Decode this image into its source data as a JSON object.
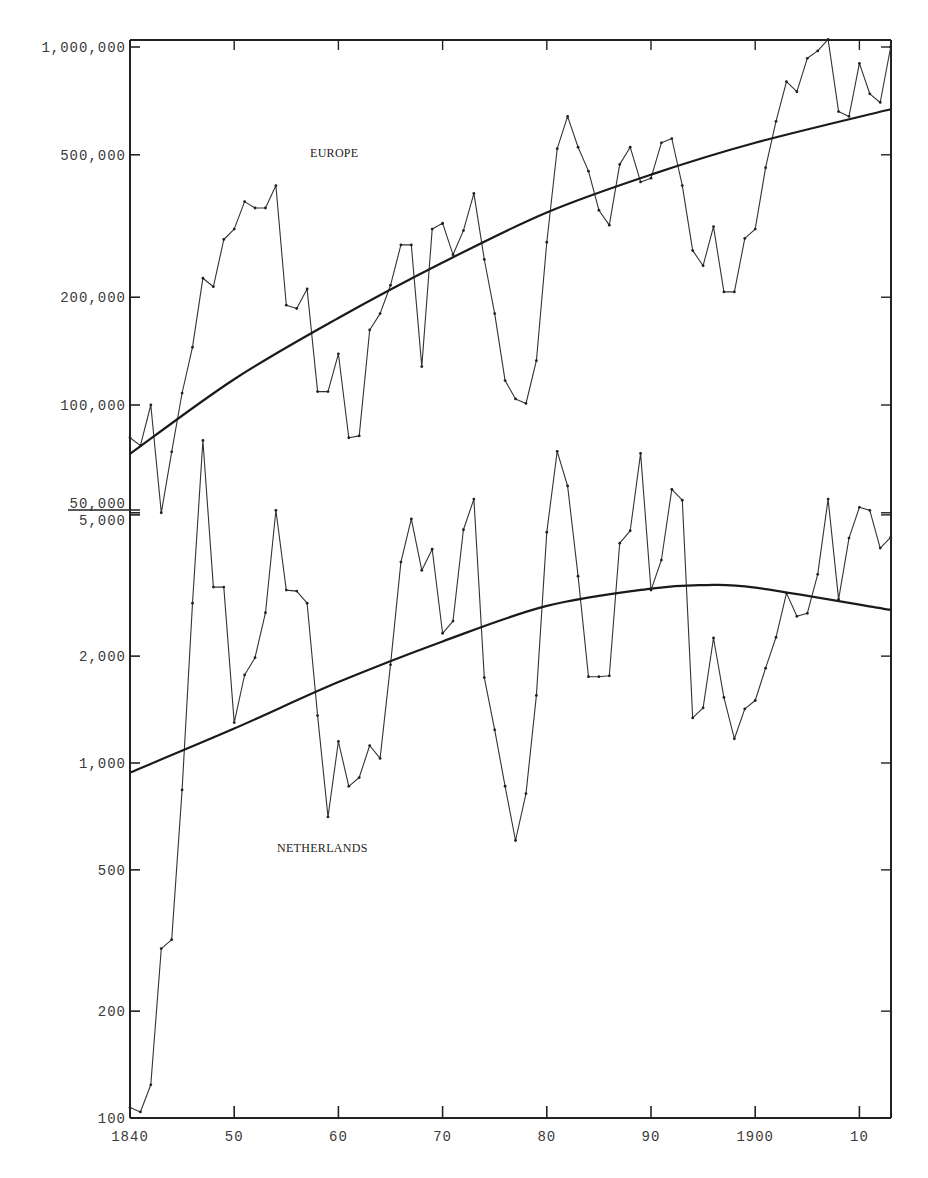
{
  "chart_data": {
    "type": "line",
    "title": "",
    "xlabel": "",
    "ylabel": "",
    "x_range": [
      1840,
      1913
    ],
    "x_ticks": [
      {
        "year": 1840,
        "label": "1840"
      },
      {
        "year": 1850,
        "label": "50"
      },
      {
        "year": 1860,
        "label": "60"
      },
      {
        "year": 1870,
        "label": "70"
      },
      {
        "year": 1880,
        "label": "80"
      },
      {
        "year": 1890,
        "label": "90"
      },
      {
        "year": 1900,
        "label": "1900"
      },
      {
        "year": 1910,
        "label": "10"
      }
    ],
    "grid": false,
    "legend": "inline labels",
    "panels": [
      {
        "name": "EUROPE",
        "label": "EUROPE",
        "yscale": "log",
        "ylim": [
          50000,
          1000000
        ],
        "y_ticks": [
          {
            "value": 1000000,
            "label": "1,000,000"
          },
          {
            "value": 500000,
            "label": "500,000"
          },
          {
            "value": 200000,
            "label": "200,000"
          },
          {
            "value": 100000,
            "label": "100,000"
          },
          {
            "value": 50000,
            "label": "50,000"
          }
        ],
        "series": [
          {
            "name": "Europe (annual)",
            "x": [
              1840,
              1841,
              1842,
              1843,
              1844,
              1845,
              1846,
              1847,
              1848,
              1849,
              1850,
              1851,
              1852,
              1853,
              1854,
              1855,
              1856,
              1857,
              1858,
              1859,
              1860,
              1861,
              1862,
              1863,
              1864,
              1865,
              1866,
              1867,
              1868,
              1869,
              1870,
              1871,
              1872,
              1873,
              1874,
              1875,
              1876,
              1877,
              1878,
              1879,
              1880,
              1881,
              1882,
              1883,
              1884,
              1885,
              1886,
              1887,
              1888,
              1889,
              1890,
              1891,
              1892,
              1893,
              1894,
              1895,
              1896,
              1897,
              1898,
              1899,
              1900,
              1901,
              1902,
              1903,
              1904,
              1905,
              1906,
              1907,
              1908,
              1909,
              1910,
              1911,
              1912,
              1913
            ],
            "values": [
              81000,
              77000,
              100000,
              50000,
              74000,
              108000,
              145000,
              226000,
              214000,
              290000,
              310000,
              370000,
              355000,
              355000,
              410000,
              190000,
              186000,
              211000,
              109000,
              109000,
              139000,
              81000,
              82000,
              162000,
              180000,
              216000,
              280000,
              280000,
              128000,
              310000,
              322000,
              263000,
              307000,
              390000,
              255000,
              180000,
              117000,
              104000,
              101000,
              133000,
              285000,
              520000,
              640000,
              525000,
              450000,
              350000,
              318000,
              470000,
              525000,
              420000,
              430000,
              540000,
              555000,
              410000,
              270000,
              245000,
              315000,
              207000,
              207000,
              292000,
              310000,
              460000,
              620000,
              800000,
              750000,
              930000,
              975000,
              1050000,
              660000,
              640000,
              900000,
              740000,
              700000,
              1000000
            ]
          },
          {
            "name": "Europe (trend)",
            "x": [
              1840,
              1850,
              1860,
              1870,
              1880,
              1890,
              1900,
              1913
            ],
            "values": [
              73000,
              118000,
              175000,
              250000,
              345000,
              440000,
              540000,
              670000
            ]
          }
        ]
      },
      {
        "name": "NETHERLANDS",
        "label": "NETHERLANDS",
        "yscale": "log",
        "ylim": [
          100,
          5000
        ],
        "y_ticks": [
          {
            "value": 5000,
            "label": "5,000"
          },
          {
            "value": 2000,
            "label": "2,000"
          },
          {
            "value": 1000,
            "label": "1,000"
          },
          {
            "value": 500,
            "label": "500"
          },
          {
            "value": 200,
            "label": "200"
          },
          {
            "value": 100,
            "label": "100"
          }
        ],
        "series": [
          {
            "name": "Netherlands (annual)",
            "x": [
              1840,
              1841,
              1842,
              1843,
              1844,
              1845,
              1846,
              1847,
              1848,
              1849,
              1850,
              1851,
              1852,
              1853,
              1854,
              1855,
              1856,
              1857,
              1858,
              1859,
              1860,
              1861,
              1862,
              1863,
              1864,
              1865,
              1866,
              1867,
              1868,
              1869,
              1870,
              1871,
              1872,
              1873,
              1874,
              1875,
              1876,
              1877,
              1878,
              1879,
              1880,
              1881,
              1882,
              1883,
              1884,
              1885,
              1886,
              1887,
              1888,
              1889,
              1890,
              1891,
              1892,
              1893,
              1894,
              1895,
              1896,
              1897,
              1898,
              1899,
              1900,
              1901,
              1902,
              1903,
              1904,
              1905,
              1906,
              1907,
              1908,
              1909,
              1910,
              1911,
              1912,
              1913
            ],
            "values": [
              107,
              104,
              124,
              300,
              318,
              840,
              2820,
              8100,
              3130,
              3130,
              1300,
              1770,
              1980,
              2650,
              5150,
              3070,
              3050,
              2820,
              1360,
              705,
              1150,
              860,
              910,
              1120,
              1030,
              1890,
              3680,
              4870,
              3490,
              4000,
              2320,
              2510,
              4540,
              5540,
              1740,
              1240,
              860,
              605,
              820,
              1550,
              4470,
              7550,
              6030,
              3360,
              1750,
              1750,
              1760,
              4160,
              4510,
              7450,
              3070,
              3730,
              5900,
              5500,
              1340,
              1430,
              2250,
              1530,
              1170,
              1420,
              1500,
              1850,
              2260,
              3010,
              2590,
              2640,
              3400,
              5540,
              2890,
              4300,
              5250,
              5150,
              4030,
              4320
            ]
          },
          {
            "name": "Netherlands (trend)",
            "x": [
              1840,
              1850,
              1860,
              1870,
              1880,
              1890,
              1895,
              1900,
              1913
            ],
            "values": [
              940,
              1250,
              1690,
              2200,
              2770,
              3100,
              3170,
              3120,
              2700
            ]
          }
        ]
      }
    ]
  },
  "labels": {
    "europe": "EUROPE",
    "netherlands": "NETHERLANDS"
  }
}
